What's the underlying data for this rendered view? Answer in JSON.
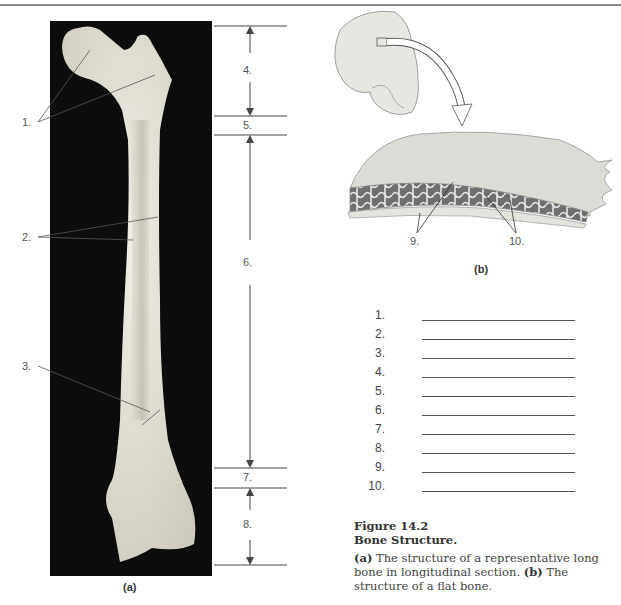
{
  "figure": {
    "number": "Figure 14.2",
    "title": "Bone Structure.",
    "caption_parts": [
      {
        "bold": "(a)",
        "text": " The structure of a representative long bone in longitudinal section. "
      },
      {
        "bold": "(b)",
        "text": " The structure of a flat bone."
      }
    ]
  },
  "panel_a": {
    "caption": "(a)",
    "subject": "long bone (femur) photograph, longitudinal section",
    "left_labels": [
      "1.",
      "2.",
      "3."
    ],
    "right_region_labels": [
      "4.",
      "5.",
      "6.",
      "7.",
      "8."
    ]
  },
  "panel_b": {
    "caption": "(b)",
    "subject": "skull with flat bone section enlarged",
    "labels": [
      "9.",
      "10."
    ]
  },
  "answer_blanks": {
    "items": [
      {
        "num": "1."
      },
      {
        "num": "2."
      },
      {
        "num": "3."
      },
      {
        "num": "4."
      },
      {
        "num": "5."
      },
      {
        "num": "6."
      },
      {
        "num": "7."
      },
      {
        "num": "8."
      },
      {
        "num": "9."
      },
      {
        "num": "10."
      }
    ]
  },
  "colors": {
    "photo_background": "#0c0c0c",
    "bone": "#e6e3d8",
    "line": "#555555",
    "text": "#444444"
  }
}
